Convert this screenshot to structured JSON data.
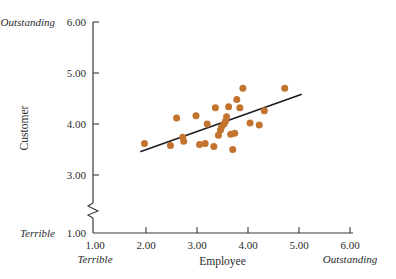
{
  "figure": {
    "background_color": "#ffffff",
    "point_color": "#c2742e",
    "line_color": "#1c1c23",
    "axis_color": "#3a3a3a"
  },
  "axes": {
    "x": {
      "title": "Employee",
      "ticks": [
        "1.00",
        "2.00",
        "3.00",
        "4.00",
        "5.00",
        "6.00"
      ],
      "tick_values": [
        1,
        2,
        3,
        4,
        5,
        6
      ],
      "low_anchor": "Terrible",
      "high_anchor": "Outstanding",
      "range": [
        1,
        6
      ]
    },
    "y": {
      "title": "Customer",
      "ticks": [
        "1.00",
        "3.00",
        "4.00",
        "5.00",
        "6.00"
      ],
      "tick_values": [
        1,
        3,
        4,
        5,
        6
      ],
      "low_anchor": "Terrible",
      "high_anchor": "Outstanding",
      "range": [
        1,
        6
      ],
      "axis_break": true,
      "break_between": [
        1,
        3
      ]
    }
  },
  "chart_data": {
    "type": "scatter",
    "title": "",
    "xlabel": "Employee",
    "ylabel": "Customer",
    "xlim": [
      1,
      6
    ],
    "ylim": [
      1,
      6
    ],
    "grid": false,
    "legend": "none",
    "x": [
      1.97,
      2.48,
      2.6,
      2.72,
      2.74,
      2.98,
      3.05,
      3.16,
      3.2,
      3.33,
      3.36,
      3.42,
      3.46,
      3.48,
      3.53,
      3.56,
      3.58,
      3.62,
      3.66,
      3.7,
      3.74,
      3.78,
      3.84,
      3.9,
      4.04,
      4.22,
      4.32,
      4.72
    ],
    "y": [
      3.62,
      3.58,
      4.12,
      3.74,
      3.66,
      4.16,
      3.6,
      3.62,
      4.0,
      3.56,
      4.32,
      3.78,
      3.88,
      3.94,
      4.0,
      4.06,
      4.14,
      4.34,
      3.8,
      3.5,
      3.82,
      4.48,
      4.32,
      4.7,
      4.02,
      3.98,
      4.26,
      4.7
    ],
    "trend_line": {
      "type": "linear-fit",
      "x_start": 1.9,
      "y_start": 3.46,
      "x_end": 5.04,
      "y_end": 4.58
    },
    "annotations": {
      "x_low": "Terrible",
      "x_high": "Outstanding",
      "y_low": "Terrible",
      "y_high": "Outstanding"
    }
  }
}
